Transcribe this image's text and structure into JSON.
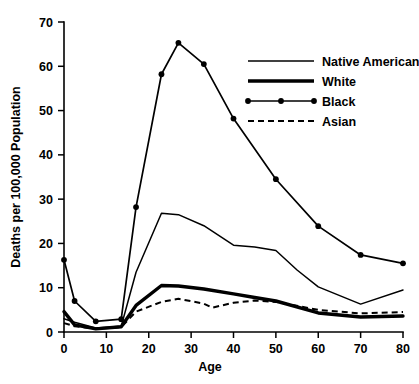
{
  "chart_data": {
    "type": "line",
    "title": "",
    "xlabel": "Age",
    "ylabel": "Deaths per 100,000 Population",
    "xlim": [
      0,
      80
    ],
    "ylim": [
      0,
      70
    ],
    "xticks": [
      0,
      10,
      20,
      30,
      40,
      50,
      60,
      70,
      80
    ],
    "yticks": [
      0,
      10,
      20,
      30,
      40,
      50,
      60,
      70
    ],
    "xtick_labels": [
      "0",
      "10",
      "20",
      "30",
      "40",
      "50",
      "60",
      "70",
      "80"
    ],
    "ytick_labels": [
      "0",
      "10",
      "20",
      "30",
      "40",
      "50",
      "60",
      "70"
    ],
    "grid": false,
    "legend_position": "upper right",
    "series": [
      {
        "name": "Native American",
        "style": "solid-thin",
        "markers": false,
        "x": [
          0,
          2.5,
          7.5,
          13.5,
          17,
          23,
          27,
          33,
          40,
          45,
          50,
          55,
          60,
          70,
          80
        ],
        "values": [
          3.0,
          2.2,
          0.9,
          1.3,
          13.5,
          26.8,
          26.5,
          24.0,
          19.6,
          19.2,
          18.4,
          14.0,
          10.2,
          6.3,
          9.5
        ]
      },
      {
        "name": "White",
        "style": "solid-thick",
        "markers": false,
        "x": [
          0,
          2.5,
          7.5,
          13.5,
          17,
          23,
          27,
          33,
          40,
          45,
          50,
          60,
          70,
          80
        ],
        "values": [
          4.6,
          1.6,
          0.7,
          1.2,
          6.0,
          10.5,
          10.4,
          9.7,
          8.6,
          7.8,
          7.0,
          4.3,
          3.4,
          3.6
        ]
      },
      {
        "name": "Black",
        "style": "solid-marker",
        "markers": true,
        "x": [
          0,
          2.5,
          7.5,
          13.5,
          17,
          23,
          27,
          33,
          40,
          50,
          60,
          70,
          80
        ],
        "values": [
          16.3,
          7.0,
          2.4,
          2.9,
          28.2,
          58.2,
          65.3,
          60.5,
          48.2,
          34.5,
          23.9,
          17.4,
          15.5
        ]
      },
      {
        "name": "Asian",
        "style": "dashed",
        "markers": false,
        "x": [
          0,
          2.5,
          7.5,
          13.5,
          17,
          23,
          27,
          33,
          35,
          40,
          45,
          50,
          60,
          70,
          80
        ],
        "values": [
          2.0,
          1.3,
          0.7,
          1.1,
          4.6,
          6.8,
          7.5,
          6.4,
          5.5,
          6.6,
          7.1,
          6.8,
          5.0,
          4.2,
          4.5
        ]
      }
    ]
  },
  "legend": {
    "entries": [
      {
        "label": "Native American",
        "style": "solid-thin"
      },
      {
        "label": "White",
        "style": "solid-thick"
      },
      {
        "label": "Black",
        "style": "solid-marker"
      },
      {
        "label": "Asian",
        "style": "dashed"
      }
    ]
  },
  "caption": {
    "partial_text": ""
  }
}
